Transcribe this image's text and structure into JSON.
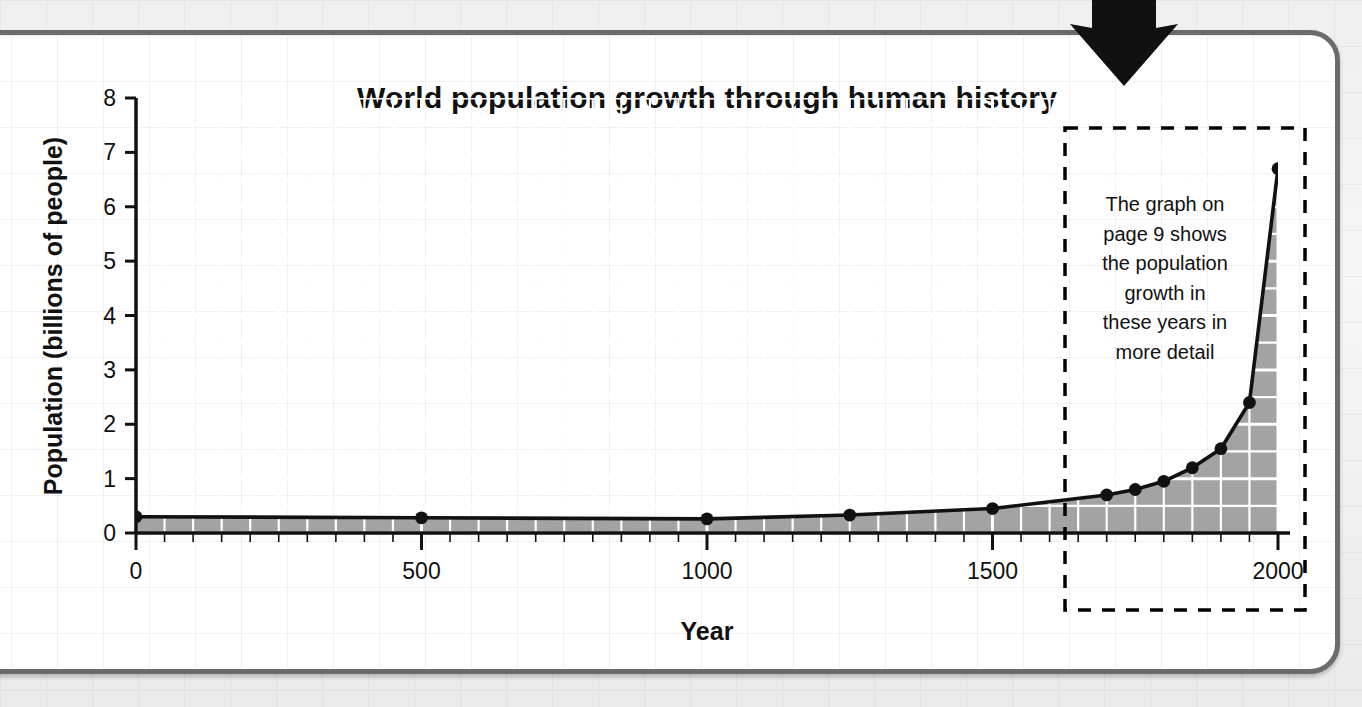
{
  "page": {
    "arrow_icon": "arrow-down-icon"
  },
  "chart_data": {
    "type": "line",
    "title": "World population growth through human history",
    "xlabel": "Year",
    "ylabel": "Population (billions of people)",
    "xlim": [
      0,
      2000
    ],
    "ylim": [
      0,
      8
    ],
    "xticks": [
      0,
      500,
      1000,
      1500,
      2000
    ],
    "xtick_labels": [
      "0",
      "500",
      "1000",
      "1500",
      "2000"
    ],
    "yticks": [
      0,
      1,
      2,
      3,
      4,
      5,
      6,
      7,
      8
    ],
    "ytick_labels": [
      "0",
      "1",
      "2",
      "3",
      "4",
      "5",
      "6",
      "7",
      "8"
    ],
    "grid": true,
    "legend": "none",
    "fill": true,
    "fill_color": "#a3a3a3",
    "line_color": "#111111",
    "marker": "circle",
    "x": [
      0,
      500,
      1000,
      1250,
      1500,
      1700,
      1750,
      1800,
      1850,
      1900,
      1950,
      2000
    ],
    "values": [
      0.3,
      0.28,
      0.26,
      0.33,
      0.45,
      0.7,
      0.8,
      0.95,
      1.2,
      1.55,
      2.4,
      6.7
    ],
    "annotations": [
      {
        "name": "detail-callout",
        "text": "The graph on page 9 shows the population growth in these years in more detail",
        "lines": [
          "The graph on",
          "page 9 shows",
          "the population",
          "growth in",
          "these years in",
          "more detail"
        ],
        "box_style": "dashed",
        "x_range": [
          1600,
          2040
        ],
        "y_range": [
          -0.85,
          7.35
        ]
      }
    ]
  }
}
